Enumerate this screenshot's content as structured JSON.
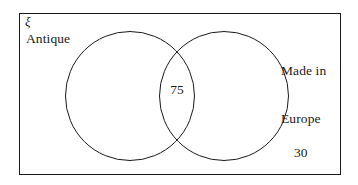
{
  "figure": {
    "type": "venn-diagram",
    "universe_symbol": "ξ",
    "sets": [
      {
        "id": "antique",
        "label": "Antique",
        "position": "left"
      },
      {
        "id": "made_in_europe",
        "label_line1": "Made in",
        "label_line2": "Europe",
        "position": "right"
      }
    ],
    "counts": {
      "intersection": "75",
      "outside_both": "30"
    }
  },
  "chart_data": {
    "type": "venn",
    "title": "",
    "universe_label": "ξ",
    "set_labels": [
      "Antique",
      "Made in Europe"
    ],
    "regions": [
      {
        "region": "antique_only",
        "value": null,
        "label": ""
      },
      {
        "region": "intersection",
        "value": 75,
        "label": "75"
      },
      {
        "region": "made_in_europe_only",
        "value": null,
        "label": ""
      },
      {
        "region": "outside_both",
        "value": 30,
        "label": "30"
      }
    ],
    "colors": {
      "stroke": "#1a1a1a",
      "fill": "#ffffff",
      "background": "#ffffff"
    }
  }
}
